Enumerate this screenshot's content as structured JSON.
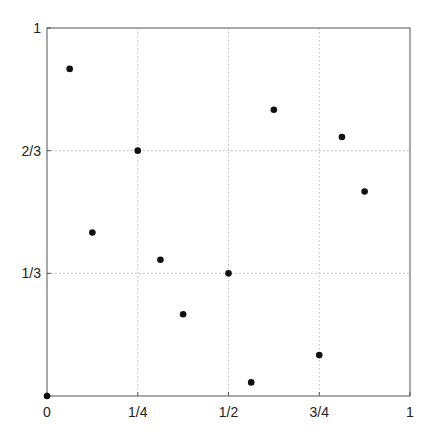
{
  "chart_data": {
    "type": "scatter",
    "title": "",
    "xlabel": "",
    "ylabel": "",
    "xlim": [
      0,
      1
    ],
    "ylim": [
      0,
      1
    ],
    "grid": true,
    "x_ticks": [
      0,
      0.25,
      0.5,
      0.75,
      1
    ],
    "x_tick_labels": [
      "0",
      "1/4",
      "1/2",
      "3/4",
      "1"
    ],
    "y_ticks": [
      0,
      0.3333,
      0.6667,
      1
    ],
    "y_tick_labels": [
      "",
      "1/3",
      "2/3",
      "1"
    ],
    "series": [
      {
        "name": "points",
        "color": "#111111",
        "x": [
          0,
          0.5,
          0.25,
          0.75,
          0.125,
          0.625,
          0.375,
          0.875,
          0.0625,
          0.5625,
          0.3125,
          0.8125
        ],
        "y": [
          0,
          0.3333,
          0.6667,
          0.1111,
          0.4444,
          0.7778,
          0.2222,
          0.5556,
          0.8889,
          0.037,
          0.3704,
          0.7037
        ]
      }
    ]
  },
  "colors": {
    "axis": "#555555",
    "grid": "#bbbbbb",
    "point": "#111111"
  }
}
